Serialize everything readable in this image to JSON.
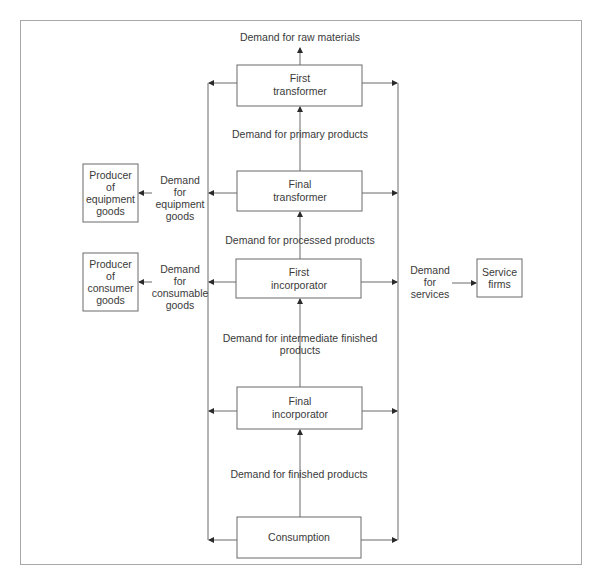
{
  "diagram": {
    "nodes": {
      "first_transformer": [
        "First",
        "transformer"
      ],
      "final_transformer": [
        "Final",
        "transformer"
      ],
      "first_incorporator": [
        "First",
        "incorporator"
      ],
      "final_incorporator": [
        "Final",
        "incorporator"
      ],
      "consumption": [
        "Consumption"
      ],
      "producer_equipment": [
        "Producer",
        "of",
        "equipment",
        "goods"
      ],
      "producer_consumer": [
        "Producer",
        "of",
        "consumer",
        "goods"
      ],
      "service_firms": [
        "Service",
        "firms"
      ]
    },
    "edges": {
      "raw_materials": [
        "Demand for raw materials"
      ],
      "primary_products": [
        "Demand for primary products"
      ],
      "processed_products": [
        "Demand for processed products"
      ],
      "intermediate_finished": [
        "Demand for intermediate finished",
        "products"
      ],
      "finished_products": [
        "Demand for finished products"
      ],
      "equipment_goods": [
        "Demand",
        "for",
        "equipment",
        "goods"
      ],
      "consumable_goods": [
        "Demand",
        "for",
        "consumable",
        "goods"
      ],
      "services": [
        "Demand",
        "for",
        "services"
      ]
    }
  }
}
